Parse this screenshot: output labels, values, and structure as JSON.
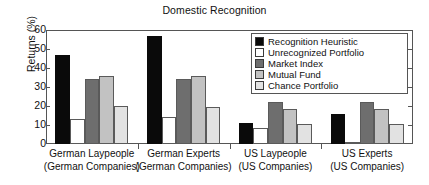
{
  "chart_data": {
    "type": "bar",
    "title": "Domestic Recognition",
    "xlabel": "",
    "ylabel": "Returns (%)",
    "ylim": [
      0,
      60
    ],
    "yticks": [
      0,
      10,
      20,
      30,
      40,
      50,
      60
    ],
    "grid": false,
    "legend_position": "top-right",
    "categories": [
      "German Laypeople\n(German Companies)",
      "German Experts\n(German Companies)",
      "US Laypeople\n(US Companies)",
      "US Experts\n(US Companies)"
    ],
    "category_lines": [
      {
        "line1": "German Laypeople",
        "line2": "(German Companies)"
      },
      {
        "line1": "German Experts",
        "line2": "(German Companies)"
      },
      {
        "line1": "US Laypeople",
        "line2": "(US Companies)"
      },
      {
        "line1": "US Experts",
        "line2": "(US Companies)"
      }
    ],
    "series": [
      {
        "name": "Recognition Heuristic",
        "color": "#0a0a0a",
        "values": [
          47,
          57,
          11,
          16
        ]
      },
      {
        "name": "Unrecognized Portfolio",
        "color": "#ffffff",
        "values": [
          13,
          14,
          8.5,
          0.5
        ]
      },
      {
        "name": "Market Index",
        "color": "#6e6e6e",
        "values": [
          34,
          34,
          22,
          22
        ]
      },
      {
        "name": "Mutual Fund",
        "color": "#c2c2c2",
        "values": [
          36,
          36,
          18.5,
          18.5
        ]
      },
      {
        "name": "Chance Portfolio",
        "color": "#e2e2e2",
        "values": [
          20,
          19.5,
          10.5,
          10.5
        ]
      }
    ]
  },
  "legend": {
    "items": [
      {
        "label": "Recognition Heuristic",
        "color": "#0a0a0a"
      },
      {
        "label": "Unrecognized Portfolio",
        "color": "#ffffff"
      },
      {
        "label": "Market Index",
        "color": "#6e6e6e"
      },
      {
        "label": "Mutual Fund",
        "color": "#c2c2c2"
      },
      {
        "label": "Chance Portfolio",
        "color": "#e2e2e2"
      }
    ]
  }
}
